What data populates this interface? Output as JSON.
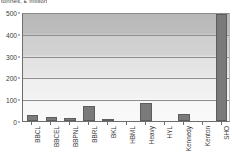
{
  "caption": "tonnes, £ million",
  "chart_data": {
    "type": "bar",
    "title": "tonnes, £ million",
    "xlabel": "",
    "ylabel": "",
    "ylim": [
      0,
      500
    ],
    "yticks": [
      0,
      100,
      200,
      300,
      400,
      500
    ],
    "ytick_labels": [
      "0",
      "100",
      "200",
      "300",
      "400",
      "500"
    ],
    "grid": true,
    "legend": "none",
    "categories": [
      "BBCL",
      "BBCEL",
      "BBPNL",
      "BBRL",
      "BKL",
      "HBML",
      "Heavy",
      "HYL",
      "Kennedy",
      "Kenton",
      "SHO"
    ],
    "values": [
      26,
      18,
      14,
      68,
      6,
      0,
      82,
      0,
      32,
      0,
      490
    ],
    "bar_color": "#7a7a7a",
    "bar_edge_color": "#5d5d5d",
    "axis_color": "#6e6e6e",
    "gridline_color": "#8e8e8e",
    "plot_bg_top": "#b9b9b9",
    "plot_bg_bottom": "#f9f9f9"
  }
}
